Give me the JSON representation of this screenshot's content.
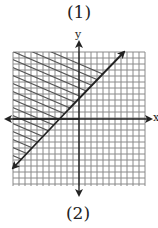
{
  "figure": {
    "top_label": "(1)",
    "bottom_label": "(2)",
    "x_axis_label": "x",
    "y_axis_label": "y"
  },
  "graph": {
    "grid": {
      "left": 13,
      "top": 52,
      "right": 145,
      "bottom": 186,
      "spacing": 6,
      "color": "#8a8a8a"
    },
    "axes": {
      "origin_x": 79,
      "origin_y": 119,
      "color": "#222222"
    },
    "boundary_line": {
      "x1": 13,
      "y1": 168,
      "x2": 124,
      "y2": 52,
      "style": "solid",
      "arrows": "both",
      "color": "#222222"
    },
    "shaded_region": {
      "side": "above-left of line",
      "pattern": "diagonal hatch",
      "color": "#6a6a6a"
    }
  },
  "colors": {
    "grid": "#8a8a8a",
    "axes": "#222222",
    "hatch": "#6a6a6a",
    "background": "#ffffff"
  }
}
